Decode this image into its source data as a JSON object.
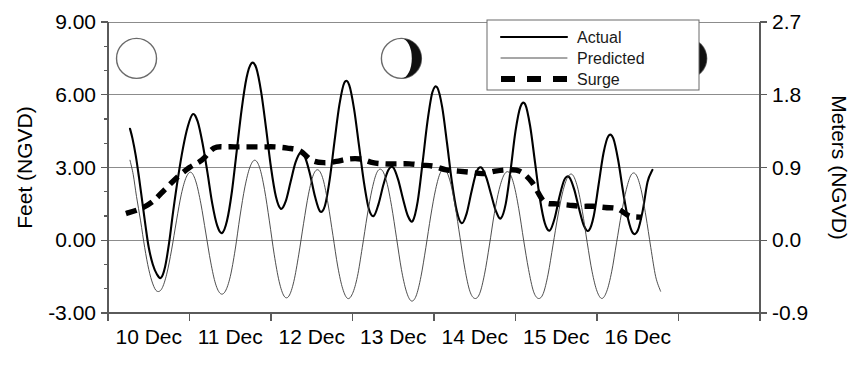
{
  "chart_data": {
    "type": "line",
    "title": "",
    "xlabel": "",
    "ylabel": "Feet (NGVD)",
    "y2label": "Meters (NGVD)",
    "grid": true,
    "legend_position": "top-center",
    "xlim": [
      0,
      8
    ],
    "ylim": [
      -3.0,
      9.0
    ],
    "y2lim": [
      -0.9,
      2.7
    ],
    "x_tick_labels": [
      "10 Dec",
      "11 Dec",
      "12 Dec",
      "13 Dec",
      "14 Dec",
      "15 Dec",
      "16 Dec"
    ],
    "x_tick_values": [
      0,
      1,
      2,
      3,
      4,
      5,
      6
    ],
    "x_minor_tick_values": [
      7,
      8
    ],
    "y_tick_labels": [
      "9.00",
      "6.00",
      "3.00",
      "0.00",
      "-3.00"
    ],
    "y_tick_values": [
      9.0,
      6.0,
      3.0,
      0.0,
      -3.0
    ],
    "y_minor_tick_values": [
      8.0,
      7.0,
      5.0,
      4.0,
      2.0,
      1.0,
      -1.0,
      -2.0
    ],
    "y2_tick_labels": [
      "2.7",
      "1.8",
      "0.9",
      "0.0",
      "-0.9"
    ],
    "y2_tick_values": [
      2.7,
      1.8,
      0.9,
      0.0,
      -0.9
    ],
    "series": [
      {
        "name": "Actual",
        "style": "solid-thick",
        "color": "#000000",
        "x": [
          0.27,
          0.3,
          0.34,
          0.38,
          0.42,
          0.46,
          0.5,
          0.55,
          0.6,
          0.65,
          0.7,
          0.75,
          0.8,
          0.86,
          0.92,
          0.98,
          1.04,
          1.1,
          1.16,
          1.22,
          1.28,
          1.34,
          1.4,
          1.46,
          1.52,
          1.58,
          1.64,
          1.7,
          1.76,
          1.82,
          1.88,
          1.94,
          2.0,
          2.06,
          2.12,
          2.18,
          2.24,
          2.3,
          2.36,
          2.42,
          2.48,
          2.54,
          2.6,
          2.66,
          2.72,
          2.78,
          2.84,
          2.9,
          2.96,
          3.02,
          3.08,
          3.14,
          3.2,
          3.26,
          3.32,
          3.38,
          3.44,
          3.5,
          3.56,
          3.62,
          3.68,
          3.74,
          3.8,
          3.86,
          3.92,
          3.98,
          4.04,
          4.1,
          4.16,
          4.22,
          4.28,
          4.34,
          4.4,
          4.46,
          4.52,
          4.58,
          4.64,
          4.7,
          4.76,
          4.82,
          4.88,
          4.94,
          5.0,
          5.06,
          5.12,
          5.18,
          5.24,
          5.3,
          5.36,
          5.42,
          5.48,
          5.54,
          5.6,
          5.66,
          5.72,
          5.78,
          5.84,
          5.9,
          5.96,
          6.02,
          6.08,
          6.14,
          6.2,
          6.26,
          6.32,
          6.38,
          6.44,
          6.5,
          6.56,
          6.62,
          6.68
        ],
        "y": [
          4.6,
          4.2,
          3.5,
          2.6,
          1.6,
          0.6,
          -0.3,
          -1.0,
          -1.4,
          -1.55,
          -1.1,
          -0.1,
          1.2,
          2.6,
          3.8,
          4.7,
          5.2,
          4.9,
          4.0,
          2.8,
          1.5,
          0.6,
          0.3,
          0.8,
          2.0,
          3.7,
          5.4,
          6.7,
          7.3,
          7.1,
          6.1,
          4.6,
          3.0,
          1.8,
          1.3,
          1.6,
          2.4,
          3.2,
          3.6,
          3.4,
          2.7,
          1.8,
          1.2,
          1.4,
          2.5,
          4.1,
          5.6,
          6.5,
          6.4,
          5.4,
          3.9,
          2.4,
          1.3,
          1.0,
          1.5,
          2.3,
          2.9,
          3.0,
          2.5,
          1.7,
          1.0,
          0.8,
          1.6,
          3.2,
          4.9,
          6.1,
          6.3,
          5.5,
          4.0,
          2.4,
          1.2,
          0.7,
          1.1,
          2.0,
          2.8,
          3.0,
          2.6,
          1.9,
          1.2,
          0.9,
          1.5,
          2.9,
          4.5,
          5.5,
          5.6,
          4.7,
          3.2,
          1.7,
          0.7,
          0.4,
          0.9,
          1.8,
          2.5,
          2.6,
          2.1,
          1.3,
          0.6,
          0.4,
          1.0,
          2.3,
          3.6,
          4.3,
          4.2,
          3.3,
          2.0,
          0.9,
          0.3,
          0.4,
          1.2,
          2.4,
          2.9
        ]
      },
      {
        "name": "Predicted",
        "style": "solid-thin",
        "color": "#3a3a3a",
        "x": [
          0.27,
          0.31,
          0.35,
          0.4,
          0.45,
          0.5,
          0.55,
          0.6,
          0.66,
          0.72,
          0.78,
          0.84,
          0.9,
          0.96,
          1.02,
          1.08,
          1.14,
          1.2,
          1.26,
          1.32,
          1.38,
          1.44,
          1.5,
          1.56,
          1.62,
          1.68,
          1.74,
          1.8,
          1.86,
          1.92,
          1.98,
          2.04,
          2.1,
          2.16,
          2.22,
          2.28,
          2.34,
          2.4,
          2.46,
          2.52,
          2.58,
          2.64,
          2.7,
          2.76,
          2.82,
          2.88,
          2.94,
          3.0,
          3.06,
          3.12,
          3.18,
          3.24,
          3.3,
          3.36,
          3.42,
          3.48,
          3.54,
          3.6,
          3.66,
          3.72,
          3.78,
          3.84,
          3.9,
          3.96,
          4.02,
          4.08,
          4.14,
          4.2,
          4.26,
          4.32,
          4.38,
          4.44,
          4.5,
          4.56,
          4.62,
          4.68,
          4.74,
          4.8,
          4.86,
          4.92,
          4.98,
          5.04,
          5.1,
          5.16,
          5.22,
          5.28,
          5.34,
          5.4,
          5.46,
          5.52,
          5.58,
          5.64,
          5.7,
          5.76,
          5.82,
          5.88,
          5.94,
          6.0,
          6.06,
          6.12,
          6.18,
          6.24,
          6.3,
          6.36,
          6.42,
          6.48,
          6.54,
          6.6,
          6.66,
          6.72,
          6.78
        ],
        "y": [
          3.3,
          2.7,
          1.8,
          0.8,
          -0.3,
          -1.2,
          -1.8,
          -2.1,
          -2.0,
          -1.4,
          -0.4,
          0.8,
          1.9,
          2.6,
          2.8,
          2.4,
          1.5,
          0.3,
          -0.9,
          -1.8,
          -2.2,
          -2.1,
          -1.5,
          -0.4,
          1.0,
          2.2,
          3.0,
          3.3,
          3.0,
          2.1,
          0.8,
          -0.6,
          -1.7,
          -2.3,
          -2.3,
          -1.7,
          -0.6,
          0.7,
          1.9,
          2.7,
          2.9,
          2.5,
          1.5,
          0.2,
          -1.1,
          -2.0,
          -2.4,
          -2.2,
          -1.5,
          -0.3,
          1.0,
          2.1,
          2.8,
          2.9,
          2.4,
          1.4,
          0.1,
          -1.2,
          -2.1,
          -2.5,
          -2.3,
          -1.5,
          -0.3,
          1.0,
          2.1,
          2.8,
          2.9,
          2.4,
          1.4,
          0.1,
          -1.2,
          -2.1,
          -2.4,
          -2.2,
          -1.4,
          -0.2,
          1.1,
          2.1,
          2.7,
          2.8,
          2.3,
          1.3,
          0.0,
          -1.2,
          -2.1,
          -2.4,
          -2.2,
          -1.4,
          -0.2,
          1.0,
          2.0,
          2.6,
          2.7,
          2.2,
          1.2,
          -0.1,
          -1.3,
          -2.1,
          -2.4,
          -2.1,
          -1.3,
          -0.1,
          1.1,
          2.1,
          2.7,
          2.7,
          2.1,
          1.0,
          -0.3,
          -1.5,
          -2.1
        ]
      },
      {
        "name": "Surge",
        "style": "dashed-thick",
        "color": "#000000",
        "x": [
          0.22,
          0.4,
          0.55,
          0.7,
          0.85,
          1.0,
          1.15,
          1.3,
          1.45,
          1.6,
          1.75,
          1.9,
          2.05,
          2.2,
          2.35,
          2.5,
          2.65,
          2.8,
          2.95,
          3.1,
          3.25,
          3.4,
          3.55,
          3.7,
          3.85,
          4.0,
          4.15,
          4.3,
          4.45,
          4.6,
          4.75,
          4.9,
          5.05,
          5.2,
          5.35,
          5.5,
          5.65,
          5.8,
          5.95,
          6.1,
          6.25,
          6.4,
          6.55
        ],
        "y": [
          1.1,
          1.3,
          1.6,
          2.1,
          2.6,
          3.0,
          3.3,
          3.8,
          3.85,
          3.85,
          3.85,
          3.85,
          3.85,
          3.8,
          3.7,
          3.3,
          3.2,
          3.25,
          3.35,
          3.35,
          3.2,
          3.15,
          3.15,
          3.15,
          3.1,
          3.05,
          2.9,
          2.85,
          2.8,
          2.75,
          2.85,
          2.9,
          2.85,
          2.4,
          1.6,
          1.5,
          1.45,
          1.4,
          1.4,
          1.35,
          1.3,
          1.0,
          0.95
        ]
      }
    ],
    "legend_entries": [
      {
        "label": "Actual",
        "style": "solid-thick"
      },
      {
        "label": "Predicted",
        "style": "solid-thin"
      },
      {
        "label": "Surge",
        "style": "dashed-thick"
      }
    ],
    "moon_phases": [
      {
        "name": "new-moon",
        "phase": "new",
        "x": 0.35,
        "y_feet": 7.5
      },
      {
        "name": "waxing-gibbous-moon",
        "phase": "waxing-gibbous",
        "x": 3.6,
        "y_feet": 7.5
      },
      {
        "name": "last-quarter-moon",
        "phase": "last-quarter",
        "x": 7.1,
        "y_feet": 7.5
      }
    ]
  },
  "colors": {
    "actual": "#000000",
    "predicted": "#3a3a3a",
    "surge": "#000000",
    "grid": "#8c8c8c",
    "frame": "#5a5a5a",
    "background": "#ffffff"
  }
}
